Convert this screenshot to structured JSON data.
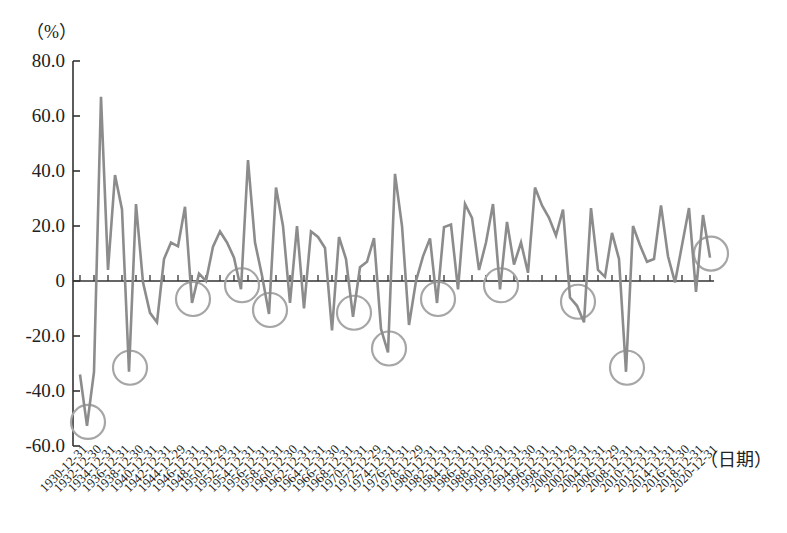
{
  "chart_data": {
    "type": "line",
    "title": "",
    "xlabel": "（日期）",
    "ylabel": "（%）",
    "ylim": [
      -60,
      80
    ],
    "yticks": [
      80,
      60,
      40,
      20,
      0,
      -20,
      -40,
      -60
    ],
    "ytick_labels": [
      "80.0",
      "60.0",
      "40.0",
      "20.0",
      "0",
      "-20.0",
      "-40.0",
      "-60.0"
    ],
    "grid": false,
    "legend": null,
    "xtick_labels": [
      "1930-12-31",
      "1932-12-30",
      "1934-12-31",
      "1936-12-31",
      "1938-12-30",
      "1940-12-31",
      "1942-12-31",
      "1944-12-29",
      "1946-12-31",
      "1948-12-31",
      "1950-12-29",
      "1952-12-31",
      "1954-12-31",
      "1956-12-31",
      "1958-12-31",
      "1960-12-30",
      "1962-12-31",
      "1964-12-31",
      "1966-12-30",
      "1968-12-31",
      "1970-12-31",
      "1972-12-29",
      "1974-12-31",
      "1976-12-31",
      "1978-12-29",
      "1980-12-31",
      "1982-12-31",
      "1984-12-31",
      "1986-12-31",
      "1988-12-30",
      "1990-12-31",
      "1992-12-31",
      "1994-12-30",
      "1996-12-31",
      "1998-12-31",
      "2000-12-29",
      "2002-12-31",
      "2004-12-31",
      "2006-12-29",
      "2008-12-31",
      "2010-12-31",
      "2012-12-31",
      "2014-12-31",
      "2016-12-30",
      "2018-12-31",
      "2020-12-31"
    ],
    "x": [
      1930,
      1931,
      1932,
      1933,
      1934,
      1935,
      1936,
      1937,
      1938,
      1939,
      1940,
      1941,
      1942,
      1943,
      1944,
      1945,
      1946,
      1947,
      1948,
      1949,
      1950,
      1951,
      1952,
      1953,
      1954,
      1955,
      1956,
      1957,
      1958,
      1959,
      1960,
      1961,
      1962,
      1963,
      1964,
      1965,
      1966,
      1967,
      1968,
      1969,
      1970,
      1971,
      1972,
      1973,
      1974,
      1975,
      1976,
      1977,
      1978,
      1979,
      1980,
      1981,
      1982,
      1983,
      1984,
      1985,
      1986,
      1987,
      1988,
      1989,
      1990,
      1991,
      1992,
      1993,
      1994,
      1995,
      1996,
      1997,
      1998,
      1999,
      2000,
      2001,
      2002,
      2003,
      2004,
      2005,
      2006,
      2007,
      2008,
      2009,
      2010,
      2011,
      2012,
      2013,
      2014,
      2015,
      2016,
      2017,
      2018,
      2019,
      2020
    ],
    "series": [
      {
        "name": "annual return",
        "color": "#8c8c8c",
        "values": [
          -34,
          -52.7,
          -33,
          67,
          4,
          38.5,
          26,
          -33,
          28,
          -0.5,
          -11.6,
          -15,
          8,
          14,
          12.6,
          27,
          -8,
          2.7,
          0,
          12.5,
          18,
          14,
          8.5,
          -3,
          44,
          14,
          2,
          -12,
          34,
          20,
          -8,
          20,
          -10,
          18,
          16,
          12,
          -18,
          16,
          8,
          -13,
          5,
          7,
          15.6,
          -17.4,
          -26,
          39,
          20,
          -16,
          0,
          9,
          15.5,
          -8,
          19.6,
          20.5,
          -3,
          28,
          23,
          4,
          14,
          28,
          -3,
          21.5,
          6,
          14,
          3,
          34,
          27.5,
          23,
          16.5,
          26,
          -6,
          -9,
          -15,
          26.5,
          4,
          1.5,
          17.5,
          8,
          -33,
          20,
          13,
          7,
          8,
          27.5,
          9,
          -0.5,
          13,
          26.5,
          -4,
          24,
          8.5
        ]
      }
    ],
    "annotations": {
      "type": "circles",
      "color": "#a6a6a6",
      "highlighted_years": [
        1931,
        1937,
        1946,
        1953,
        1957,
        1969,
        1974,
        1981,
        1990,
        2001,
        2008,
        2020
      ]
    }
  }
}
